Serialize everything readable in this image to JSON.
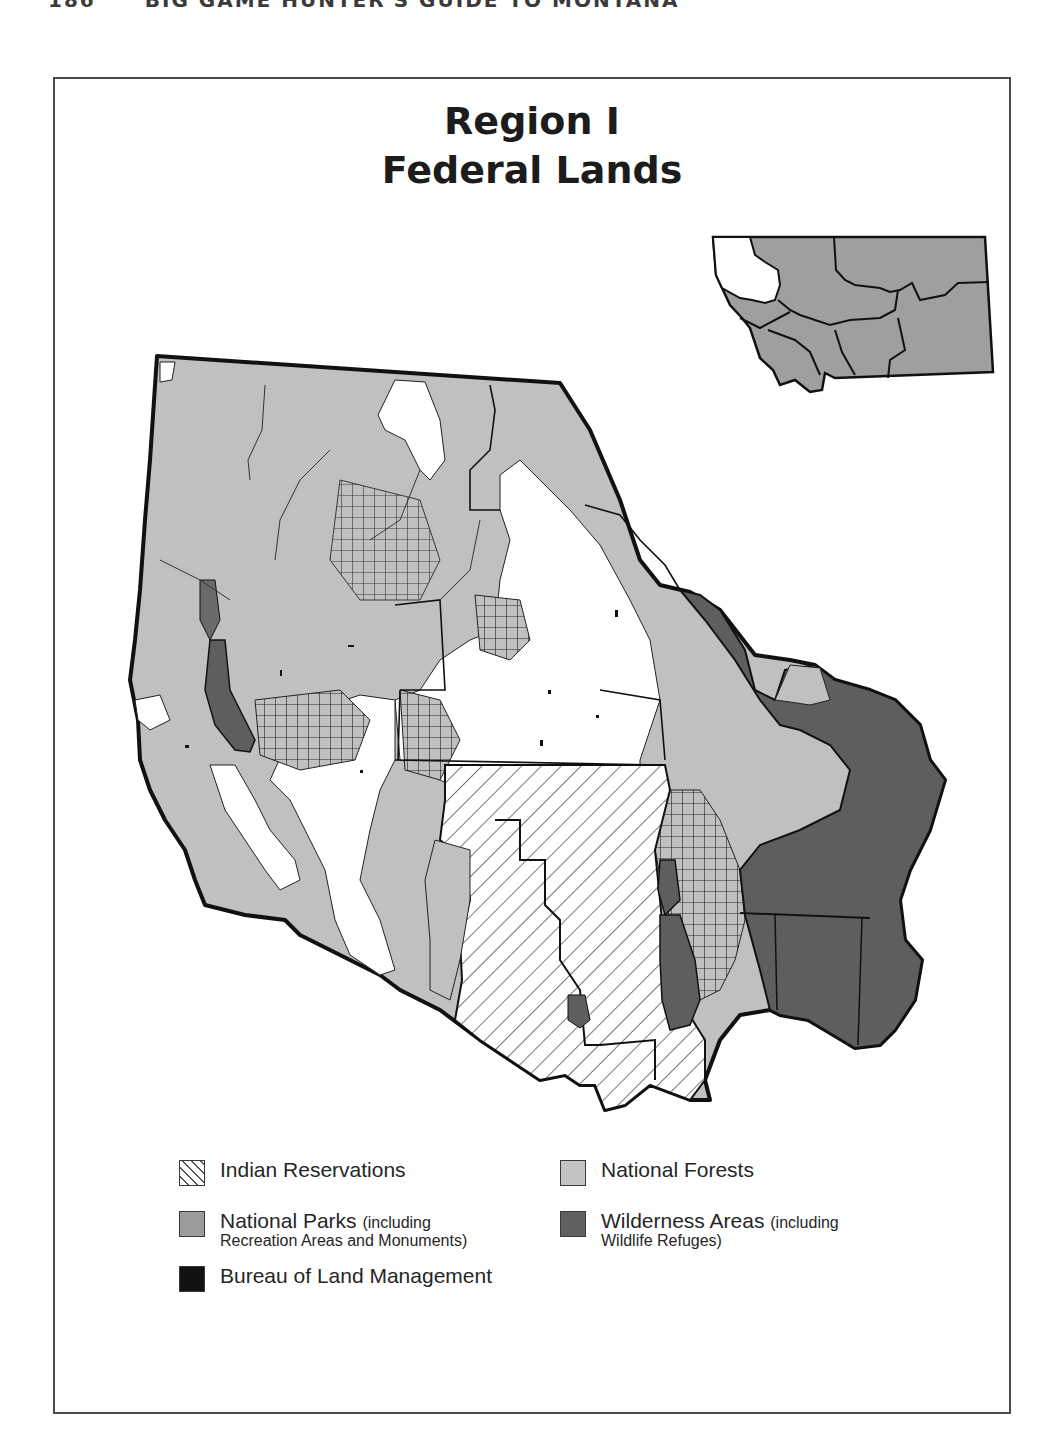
{
  "page": {
    "page_number": "186",
    "running_head": "BIG GAME HUNTER'S GUIDE TO MONTANA"
  },
  "map": {
    "title_line1": "Region I",
    "title_line2": "Federal Lands",
    "inset": {
      "description": "Montana locator map with Region 1 highlighted",
      "highlight_region": "Region 1 (northwest)",
      "region_count": 7
    },
    "colors": {
      "national_forest": "#bdbdbd",
      "national_park": "#9a9a9a",
      "wilderness": "#5e5e5e",
      "blm": "#111111",
      "reservation_hatch": "#444444",
      "private": "#ffffff",
      "boundary": "#111111"
    }
  },
  "legend": {
    "items": [
      {
        "id": "indian-reservations",
        "label": "Indian Reservations",
        "note": "",
        "swatch": "hatch"
      },
      {
        "id": "national-forests",
        "label": "National Forests",
        "note": "",
        "swatch": "#c4c4c4"
      },
      {
        "id": "national-parks",
        "label": "National Parks",
        "note": "(including",
        "note2": "Recreation Areas and Monuments)",
        "swatch": "#9c9c9c"
      },
      {
        "id": "wilderness-areas",
        "label": "Wilderness Areas",
        "note": "(including",
        "note2": "Wildlife Refuges)",
        "swatch": "#606060"
      },
      {
        "id": "blm",
        "label": "Bureau of Land Management",
        "note": "",
        "swatch": "#111111"
      }
    ]
  }
}
